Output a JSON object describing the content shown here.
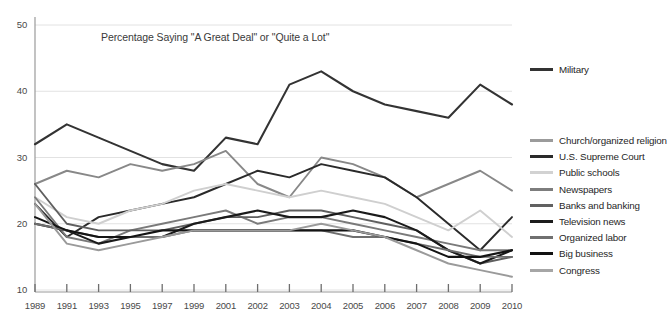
{
  "chart_data": {
    "type": "line",
    "title": "Percentage Saying \"A Great Deal\" or \"Quite a Lot\"",
    "xlabel": "",
    "ylabel": "",
    "grid": true,
    "legend_position": "right",
    "ylim": [
      10,
      50
    ],
    "yticks": [
      50,
      40,
      30,
      20,
      10
    ],
    "categories": [
      "1989",
      "1991",
      "1993",
      "1995",
      "1997",
      "1999",
      "2001",
      "2002",
      "2003",
      "2004",
      "2005",
      "2006",
      "2007",
      "2008",
      "2009",
      "2010"
    ],
    "series": [
      {
        "name": "Military",
        "color": "#333333",
        "width": 2.1,
        "values": [
          32,
          35,
          33,
          31,
          29,
          28,
          33,
          32,
          41,
          43,
          40,
          38,
          37,
          36,
          41,
          38
        ]
      },
      {
        "name": "Church/organized religion",
        "color": "#888888",
        "width": 1.9,
        "values": [
          26,
          28,
          27,
          29,
          28,
          29,
          31,
          26,
          24,
          30,
          29,
          27,
          24,
          26,
          28,
          25
        ]
      },
      {
        "name": "U.S. Supreme Court",
        "color": "#2a2a2a",
        "width": 1.9,
        "values": [
          23,
          18,
          21,
          22,
          23,
          24,
          26,
          28,
          27,
          29,
          28,
          27,
          24,
          20,
          16,
          21
        ]
      },
      {
        "name": "Public schools",
        "color": "#cfcfcf",
        "width": 1.9,
        "values": [
          24,
          21,
          20,
          22,
          23,
          25,
          26,
          25,
          24,
          25,
          24,
          23,
          21,
          19,
          22,
          18
        ]
      },
      {
        "name": "Newspapers",
        "color": "#7a7a7a",
        "width": 1.9,
        "values": [
          24,
          18,
          17,
          19,
          20,
          21,
          22,
          20,
          21,
          21,
          20,
          19,
          18,
          17,
          16,
          16
        ]
      },
      {
        "name": "Banks and banking",
        "color": "#5f5f5f",
        "width": 1.9,
        "values": [
          26,
          20,
          19,
          19,
          19,
          20,
          21,
          21,
          22,
          22,
          21,
          20,
          19,
          16,
          14,
          15
        ]
      },
      {
        "name": "Television news",
        "color": "#1a1a1a",
        "width": 2.1,
        "values": [
          20,
          19,
          17,
          18,
          18,
          20,
          21,
          22,
          21,
          21,
          22,
          21,
          19,
          16,
          14,
          16
        ]
      },
      {
        "name": "Organized labor",
        "color": "#6e6e6e",
        "width": 1.9,
        "values": [
          20,
          19,
          18,
          18,
          18,
          19,
          19,
          19,
          19,
          19,
          18,
          18,
          17,
          16,
          15,
          15
        ]
      },
      {
        "name": "Big business",
        "color": "#141414",
        "width": 2.1,
        "values": [
          21,
          19,
          18,
          18,
          19,
          19,
          19,
          19,
          19,
          19,
          19,
          18,
          17,
          15,
          15,
          16
        ]
      },
      {
        "name": "Congress",
        "color": "#9a9a9a",
        "width": 1.9,
        "values": [
          23,
          17,
          16,
          17,
          18,
          19,
          19,
          19,
          19,
          20,
          19,
          18,
          16,
          14,
          13,
          12
        ]
      }
    ]
  },
  "legend": {
    "items": [
      {
        "label": "Military",
        "color": "#333333"
      },
      {
        "label": "Church/organized religion",
        "color": "#9b9b9b"
      },
      {
        "label": "U.S. Supreme Court",
        "color": "#2a2a2a"
      },
      {
        "label": "Public schools",
        "color": "#d2d2d2"
      },
      {
        "label": "Newspapers",
        "color": "#7d7d7d"
      },
      {
        "label": "Banks and banking",
        "color": "#616161"
      },
      {
        "label": "Television news",
        "color": "#1c1c1c"
      },
      {
        "label": "Organized labor",
        "color": "#707070"
      },
      {
        "label": "Big business",
        "color": "#121212"
      },
      {
        "label": "Congress",
        "color": "#a6a6a6"
      }
    ]
  },
  "axes": {
    "y_labels": [
      "50",
      "40",
      "30",
      "20",
      "10"
    ],
    "x_labels": [
      "1989",
      "1991",
      "1993",
      "1995",
      "1997",
      "1999",
      "2001",
      "2002",
      "2003",
      "2004",
      "2005",
      "2006",
      "2007",
      "2008",
      "2009",
      "2010"
    ]
  }
}
